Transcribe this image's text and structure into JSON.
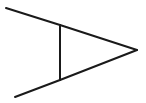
{
  "diagram": {
    "stroke_color": "#1a1a1a",
    "stroke_width": 2,
    "background": "#ffffff",
    "segments": {
      "top_leg": {
        "x1": 6,
        "y1": 8,
        "x2": 60,
        "y2": 25
      },
      "top_edge": {
        "x1": 60,
        "y1": 25,
        "x2": 137,
        "y2": 50
      },
      "bottom_edge": {
        "x1": 60,
        "y1": 80,
        "x2": 137,
        "y2": 50
      },
      "bottom_leg": {
        "x1": 15,
        "y1": 97,
        "x2": 60,
        "y2": 80
      },
      "vertical_bar": {
        "x1": 60,
        "y1": 25,
        "x2": 60,
        "y2": 80
      }
    }
  }
}
